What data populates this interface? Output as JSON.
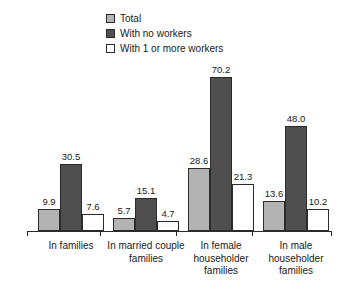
{
  "chart_data": {
    "type": "bar",
    "title": "",
    "subtitle": "",
    "xlabel": "",
    "ylabel": "",
    "ylim": [
      0,
      70.2
    ],
    "grid": false,
    "legend_position": "top-center",
    "categories": [
      "In families",
      "In married couple families",
      "In female householder families",
      "In male householder families"
    ],
    "category_lines": [
      [
        "In families"
      ],
      [
        "In married couple",
        "families"
      ],
      [
        "In female",
        "householder",
        "families"
      ],
      [
        "In male",
        "householder",
        "families"
      ]
    ],
    "series": [
      {
        "name": "Total",
        "values": [
          9.9,
          5.7,
          28.6,
          13.6
        ],
        "color": "#b3b3b3"
      },
      {
        "name": "With no workers",
        "values": [
          30.5,
          15.1,
          70.2,
          48.0
        ],
        "color": "#4f4f4f"
      },
      {
        "name": "With 1 or more workers",
        "values": [
          7.6,
          4.7,
          21.3,
          10.2
        ],
        "color": "#ffffff"
      }
    ],
    "value_labels": [
      [
        "9.9",
        "30.5",
        "7.6"
      ],
      [
        "5.7",
        "15.1",
        "4.7"
      ],
      [
        "28.6",
        "70.2",
        "21.3"
      ],
      [
        "13.6",
        "48.0",
        "10.2"
      ]
    ]
  },
  "legend": {
    "items": [
      {
        "label": "Total",
        "swatch": "light-gray"
      },
      {
        "label": "With no workers",
        "swatch": "dark-gray"
      },
      {
        "label": "With 1 or more workers",
        "swatch": "white"
      }
    ]
  },
  "colors": {
    "series_total": "#b3b3b3",
    "series_no_workers": "#4f4f4f",
    "series_one_or_more": "#ffffff",
    "outline": "#2b2b2b",
    "text": "#1a1a1a",
    "background": "#ffffff"
  }
}
